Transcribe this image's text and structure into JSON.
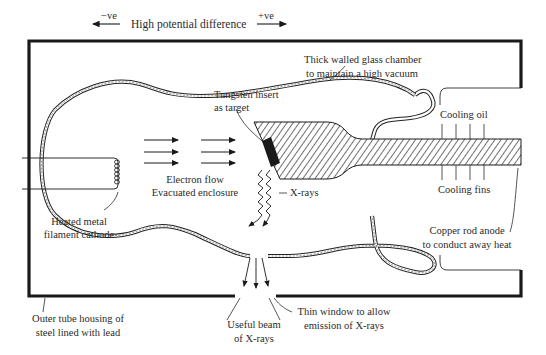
{
  "potential": {
    "negative": "−ve",
    "label": "High potential difference",
    "positive": "+ve"
  },
  "labels": {
    "glass_chamber": [
      "Thick walled glass chamber",
      "to maintain a high vacuum"
    ],
    "tungsten": [
      "Tungsten insert",
      "as target"
    ],
    "cooling_oil": "Cooling oil",
    "cooling_fins": "Cooling fins",
    "electron_flow": [
      "Electron flow",
      "Evacuated enclosure"
    ],
    "xrays": "X-rays",
    "cathode": [
      "Heated metal",
      "filament cathode"
    ],
    "anode": [
      "Copper rod anode",
      "to conduct away heat"
    ],
    "housing": [
      "Outer tube housing of",
      "steel lined with lead"
    ],
    "window": [
      "Thin window to allow",
      "emission of X-rays"
    ],
    "beam": [
      "Useful beam",
      "of X-rays"
    ]
  },
  "colors": {
    "line": "#1a1a1a",
    "text": "#2b2b2b",
    "background": "#ffffff"
  }
}
